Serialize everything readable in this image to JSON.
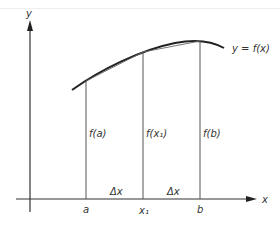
{
  "diagram": {
    "axes": {
      "x_label": "x",
      "y_label": "y"
    },
    "curve_label": "y = f(x)",
    "ordinates": [
      {
        "label": "f(a)",
        "base": "a"
      },
      {
        "label": "f(x₁)",
        "base": "x₁"
      },
      {
        "label": "f(b)",
        "base": "b"
      }
    ],
    "intervals": [
      "Δx",
      "Δx"
    ],
    "colors": {
      "stroke": "#333333",
      "thin": "#555555"
    }
  }
}
